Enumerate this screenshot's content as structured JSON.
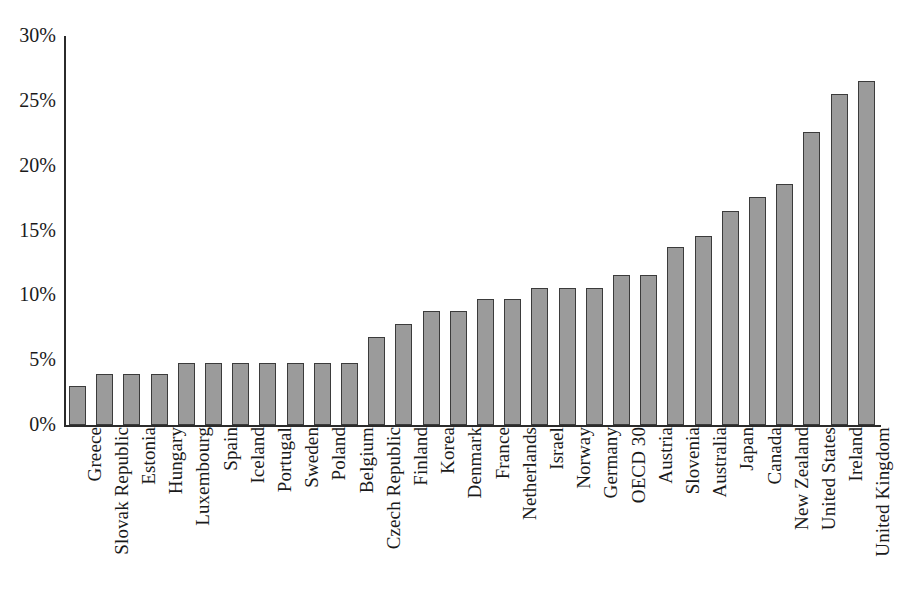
{
  "chart_data": {
    "type": "bar",
    "title": "",
    "subtitle": "",
    "xlabel": "",
    "ylabel": "",
    "ylim": [
      0,
      30
    ],
    "ytick_values": [
      0,
      5,
      10,
      15,
      20,
      25,
      30
    ],
    "ytick_labels": [
      "0%",
      "5%",
      "10%",
      "15%",
      "20%",
      "25%",
      "30%"
    ],
    "grid": "horizontal-dotted",
    "legend": "none",
    "bar_color": "#9b9b9b",
    "bar_border_color": "#3b3b3b",
    "background_color": "#ffffff",
    "axis_color": "#2b2b2b",
    "value_unit": "percent",
    "categories": [
      "Greece",
      "Slovak Republic",
      "Estonia",
      "Hungary",
      "Luxembourg",
      "Spain",
      "Iceland",
      "Portugal",
      "Sweden",
      "Poland",
      "Belgium",
      "Czech Republic",
      "Finland",
      "Korea",
      "Denmark",
      "France",
      "Netherlands",
      "Israel",
      "Norway",
      "Germany",
      "OECD 30",
      "Austria",
      "Slovenia",
      "Australia",
      "Japan",
      "Canada",
      "New Zealand",
      "United States",
      "Ireland",
      "United Kingdom"
    ],
    "values": [
      3.0,
      3.9,
      3.9,
      3.9,
      4.8,
      4.8,
      4.8,
      4.8,
      4.8,
      4.8,
      4.8,
      6.8,
      7.8,
      8.8,
      8.8,
      9.7,
      9.7,
      10.6,
      10.6,
      10.6,
      11.6,
      11.6,
      13.7,
      14.6,
      16.5,
      17.6,
      18.6,
      22.6,
      25.5,
      26.5
    ]
  }
}
